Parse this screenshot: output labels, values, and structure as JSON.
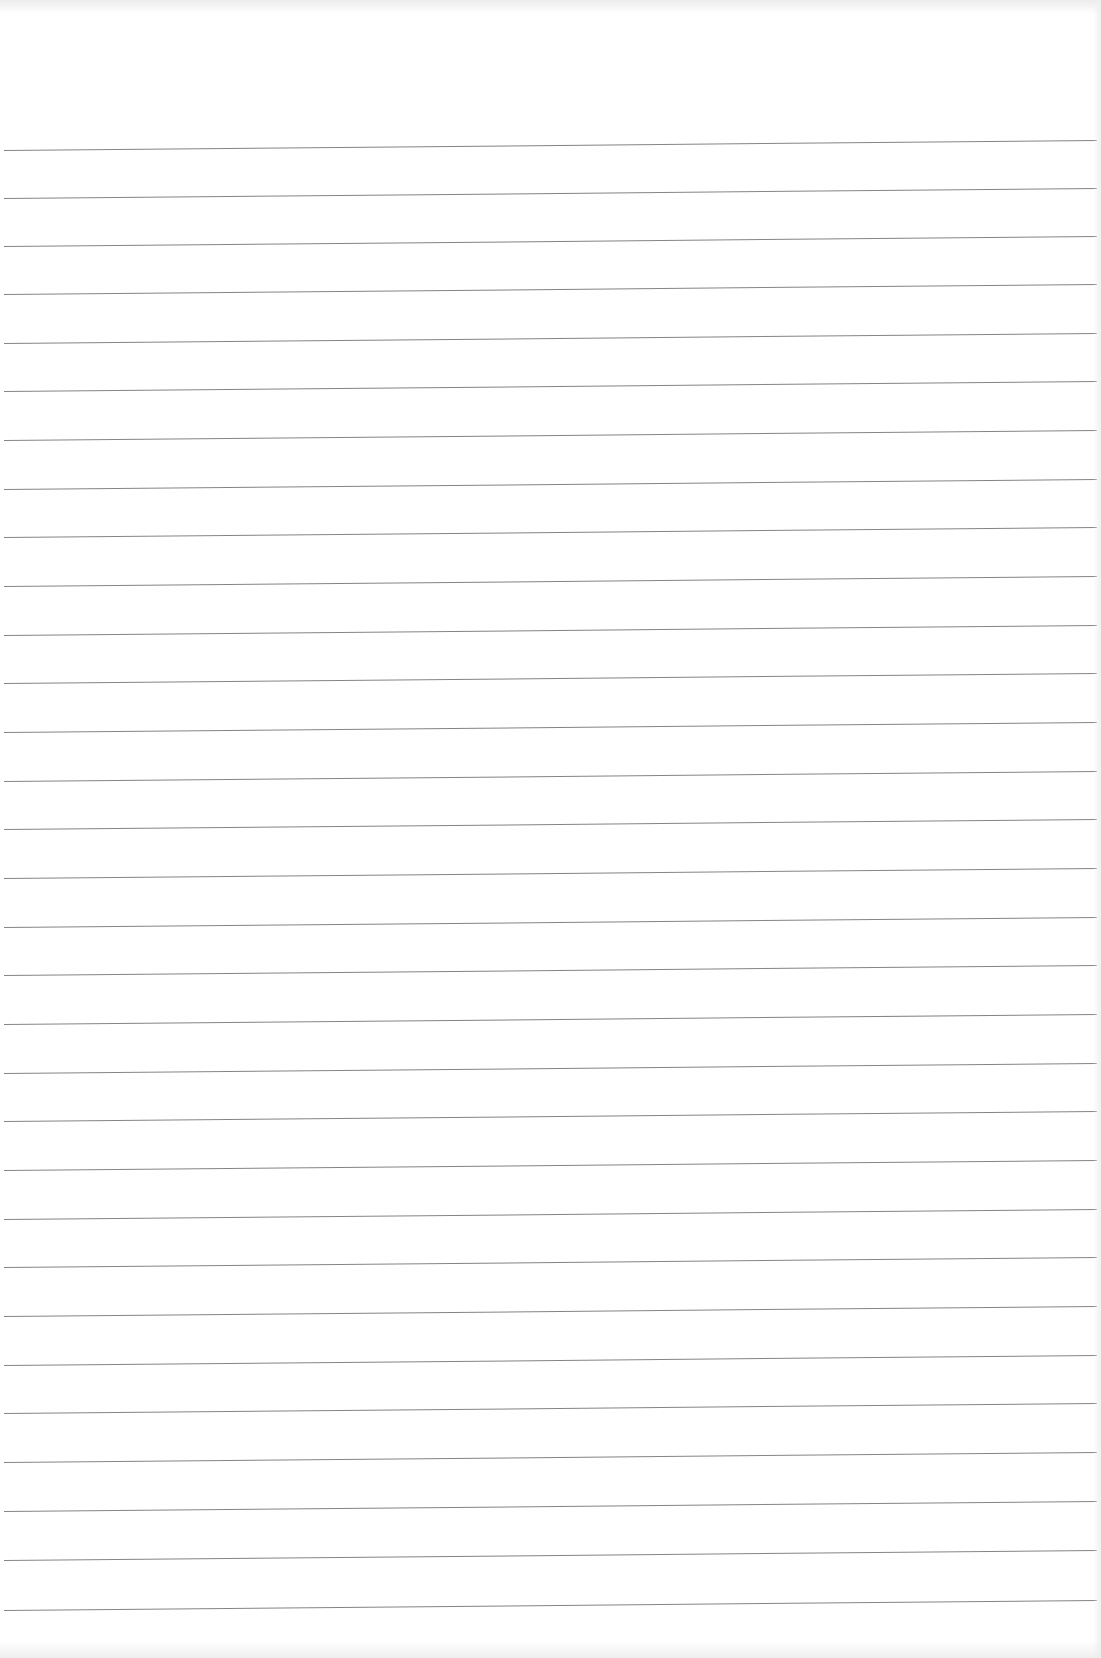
{
  "document": {
    "type": "blank lined paper",
    "rule_count": 31,
    "rule_color": "#6f6f6f",
    "background_color": "#ffffff",
    "rules_y": [
      150,
      198,
      246,
      294,
      343,
      391,
      440,
      489,
      537,
      586,
      635,
      683,
      732,
      781,
      829,
      878,
      927,
      975,
      1024,
      1073,
      1121,
      1170,
      1219,
      1267,
      1316,
      1365,
      1413,
      1462,
      1511,
      1560,
      1610
    ]
  }
}
